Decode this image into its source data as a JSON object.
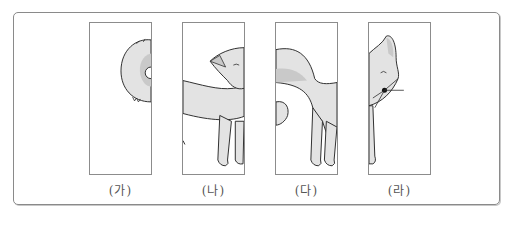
{
  "figure": {
    "panels": [
      {
        "id": "ga",
        "label": "(가)",
        "content": "fox-tail-curl"
      },
      {
        "id": "na",
        "label": "(나)",
        "content": "fox-tail-and-hindquarter"
      },
      {
        "id": "da",
        "label": "(다)",
        "content": "fox-body-and-legs"
      },
      {
        "id": "ra",
        "label": "(라)",
        "content": "fox-head-and-front-leg"
      }
    ],
    "colors": {
      "frame": "#8a8a8a",
      "panel_border": "#8c8c8c",
      "fur": "#e3e3e3",
      "fur_shade": "#c9c9c9",
      "outline": "#2a2a2a",
      "label": "#555555"
    }
  }
}
